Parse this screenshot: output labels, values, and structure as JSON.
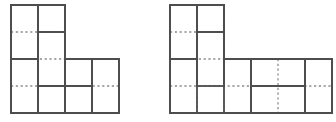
{
  "document": {
    "title": "Two rectangle-dissection figures",
    "background_color": "#ffffff",
    "width": 336,
    "height": 122
  },
  "style": {
    "solid_line_color": "#4d4d4d",
    "solid_line_width": 1.8,
    "dotted_line_color": "#8c8c8c",
    "dotted_line_width": 1.3,
    "dash_pattern": "2.2 2.6",
    "fill_color": "#ffffff"
  },
  "figures": [
    {
      "name": "left-figure",
      "label": "",
      "unit": 27.0,
      "origin": {
        "x": 11,
        "y": 5
      },
      "grid_columns": 4,
      "grid_rows": 4,
      "outline": [
        {
          "x": 0,
          "y": 0
        },
        {
          "x": 2,
          "y": 0
        },
        {
          "x": 2,
          "y": 2
        },
        {
          "x": 4,
          "y": 2
        },
        {
          "x": 4,
          "y": 4
        },
        {
          "x": 0,
          "y": 4
        }
      ],
      "tiles": [
        {
          "name": "tile-top-left",
          "x": 0,
          "y": 0,
          "w": 1,
          "h": 2
        },
        {
          "name": "tile-top-right",
          "x": 1,
          "y": 0,
          "w": 1,
          "h": 1
        },
        {
          "name": "tile-center-tall",
          "x": 1,
          "y": 1,
          "w": 1,
          "h": 2
        },
        {
          "name": "tile-mid-right",
          "x": 2,
          "y": 2,
          "w": 1,
          "h": 1
        },
        {
          "name": "tile-far-right",
          "x": 3,
          "y": 2,
          "w": 1,
          "h": 2
        },
        {
          "name": "tile-bottom-left",
          "x": 0,
          "y": 2,
          "w": 1,
          "h": 2
        },
        {
          "name": "tile-bottom-mid",
          "x": 1,
          "y": 3,
          "w": 1,
          "h": 1
        },
        {
          "name": "tile-bottom-right",
          "x": 2,
          "y": 3,
          "w": 1,
          "h": 1
        }
      ],
      "grid_lines": {
        "vertical": [
          {
            "x": 1,
            "y0": 0,
            "y1": 4
          },
          {
            "x": 2,
            "y0": 0,
            "y1": 4
          },
          {
            "x": 3,
            "y0": 2,
            "y1": 4
          }
        ],
        "horizontal": [
          {
            "y": 1,
            "x0": 0,
            "x1": 2
          },
          {
            "y": 2,
            "x0": 0,
            "x1": 4
          },
          {
            "y": 3,
            "x0": 0,
            "x1": 4
          }
        ]
      }
    },
    {
      "name": "right-figure",
      "label": "",
      "unit": 27.0,
      "origin": {
        "x": 170,
        "y": 5
      },
      "grid_columns": 6,
      "grid_rows": 4,
      "outline": [
        {
          "x": 0,
          "y": 0
        },
        {
          "x": 2,
          "y": 0
        },
        {
          "x": 2,
          "y": 2
        },
        {
          "x": 6,
          "y": 2
        },
        {
          "x": 6,
          "y": 4
        },
        {
          "x": 0,
          "y": 4
        }
      ],
      "tiles": [
        {
          "name": "tile-top-left",
          "x": 0,
          "y": 0,
          "w": 1,
          "h": 2
        },
        {
          "name": "tile-top-right",
          "x": 1,
          "y": 0,
          "w": 1,
          "h": 1
        },
        {
          "name": "tile-center-tall",
          "x": 1,
          "y": 1,
          "w": 1,
          "h": 2
        },
        {
          "name": "tile-left-lower",
          "x": 0,
          "y": 2,
          "w": 1,
          "h": 2
        },
        {
          "name": "tile-column-three",
          "x": 2,
          "y": 2,
          "w": 1,
          "h": 2
        },
        {
          "name": "tile-mid-upper",
          "x": 3,
          "y": 2,
          "w": 2,
          "h": 1
        },
        {
          "name": "tile-mid-lower",
          "x": 3,
          "y": 3,
          "w": 2,
          "h": 1
        },
        {
          "name": "tile-far-right",
          "x": 5,
          "y": 2,
          "w": 1,
          "h": 2
        }
      ],
      "grid_lines": {
        "vertical": [
          {
            "x": 1,
            "y0": 0,
            "y1": 4
          },
          {
            "x": 2,
            "y0": 0,
            "y1": 4
          },
          {
            "x": 3,
            "y0": 2,
            "y1": 4
          },
          {
            "x": 4,
            "y0": 2,
            "y1": 4
          },
          {
            "x": 5,
            "y0": 2,
            "y1": 4
          }
        ],
        "horizontal": [
          {
            "y": 1,
            "x0": 0,
            "x1": 2
          },
          {
            "y": 2,
            "x0": 0,
            "x1": 2
          },
          {
            "y": 3,
            "x0": 0,
            "x1": 6
          }
        ]
      }
    }
  ]
}
